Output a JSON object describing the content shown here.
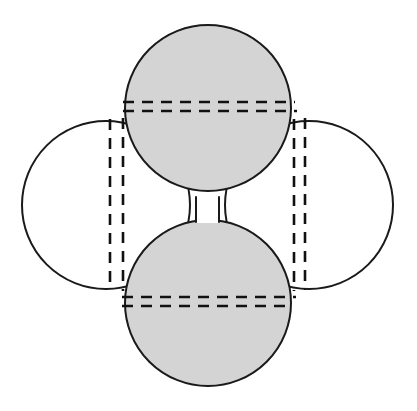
{
  "canvas": {
    "width": 417,
    "height": 411,
    "background": "#ffffff",
    "title": "Four overlapping circles arranged in a cross pattern with dashed chord lines"
  },
  "style": {
    "shaded_fill": "#d4d4d4",
    "plain_fill": "#ffffff",
    "stroke": "#1a1a1a",
    "stroke_width": 2.0,
    "dash_stroke": "#111111",
    "dash_stroke_width": 2.6,
    "dash_pattern": "11 8"
  },
  "circles": [
    {
      "name": "top-circle",
      "position": "top",
      "cx": 208,
      "cy": 108,
      "r": 83,
      "fill": "shaded",
      "label": "Top shaded circle"
    },
    {
      "name": "bottom-circle",
      "position": "bottom",
      "cx": 208,
      "cy": 303,
      "r": 83,
      "fill": "shaded",
      "label": "Bottom shaded circle"
    },
    {
      "name": "left-circle",
      "position": "left",
      "cx": 106,
      "cy": 205,
      "r": 84,
      "fill": "plain",
      "label": "Left open circle"
    },
    {
      "name": "right-circle",
      "position": "right",
      "cx": 309,
      "cy": 205,
      "r": 84,
      "fill": "plain",
      "label": "Right open circle"
    }
  ],
  "dashed_lines": [
    {
      "name": "top-chord-upper",
      "orientation": "horizontal",
      "axis_value": 102,
      "from": 123,
      "to": 295,
      "belongs_to": "top-circle"
    },
    {
      "name": "top-chord-lower",
      "orientation": "horizontal",
      "axis_value": 111,
      "from": 123,
      "to": 297,
      "belongs_to": "top-circle"
    },
    {
      "name": "bottom-chord-upper",
      "orientation": "horizontal",
      "axis_value": 297,
      "from": 122,
      "to": 296,
      "belongs_to": "bottom-circle"
    },
    {
      "name": "bottom-chord-lower",
      "orientation": "horizontal",
      "axis_value": 306,
      "from": 122,
      "to": 293,
      "belongs_to": "bottom-circle"
    },
    {
      "name": "left-chord-outer",
      "orientation": "vertical",
      "axis_value": 110,
      "from": 119,
      "to": 290,
      "belongs_to": "left-circle"
    },
    {
      "name": "left-chord-inner",
      "orientation": "vertical",
      "axis_value": 123,
      "from": 118,
      "to": 291,
      "belongs_to": "left-circle"
    },
    {
      "name": "right-chord-inner",
      "orientation": "vertical",
      "axis_value": 294,
      "from": 119,
      "to": 291,
      "belongs_to": "right-circle"
    },
    {
      "name": "right-chord-outer",
      "orientation": "vertical",
      "axis_value": 305,
      "from": 118,
      "to": 290,
      "belongs_to": "right-circle"
    }
  ],
  "center_gap": {
    "name": "center-white-gap",
    "x": 196,
    "y": 196,
    "width": 23,
    "height": 27,
    "fill": "#ffffff",
    "label": "Small white rectangular gap at the centre where the four circles meet"
  }
}
